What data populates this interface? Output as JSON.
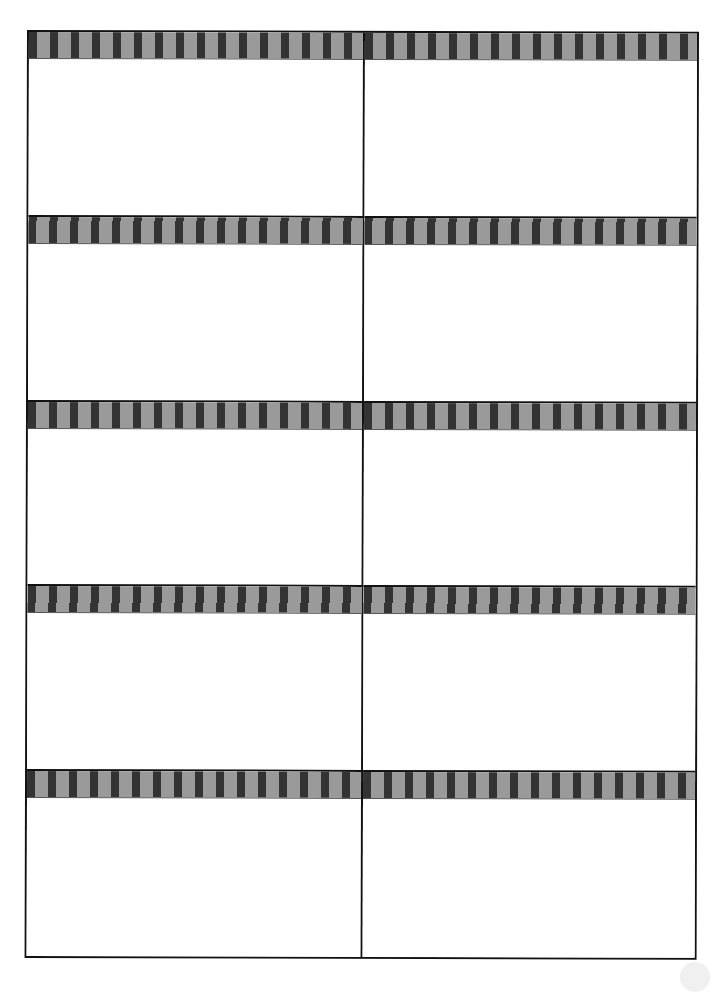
{
  "document": {
    "type": "label-sheet",
    "columns": 2,
    "rows": 5,
    "colors": {
      "border": "#111111",
      "stripe_dark": "#333333",
      "stripe_light": "#9a9a9a",
      "background": "#ffffff"
    },
    "labels": [
      {
        "row": 1,
        "col": 1,
        "text": ""
      },
      {
        "row": 1,
        "col": 2,
        "text": ""
      },
      {
        "row": 2,
        "col": 1,
        "text": ""
      },
      {
        "row": 2,
        "col": 2,
        "text": ""
      },
      {
        "row": 3,
        "col": 1,
        "text": ""
      },
      {
        "row": 3,
        "col": 2,
        "text": ""
      },
      {
        "row": 4,
        "col": 1,
        "text": ""
      },
      {
        "row": 4,
        "col": 2,
        "text": ""
      },
      {
        "row": 5,
        "col": 1,
        "text": ""
      },
      {
        "row": 5,
        "col": 2,
        "text": ""
      }
    ]
  }
}
